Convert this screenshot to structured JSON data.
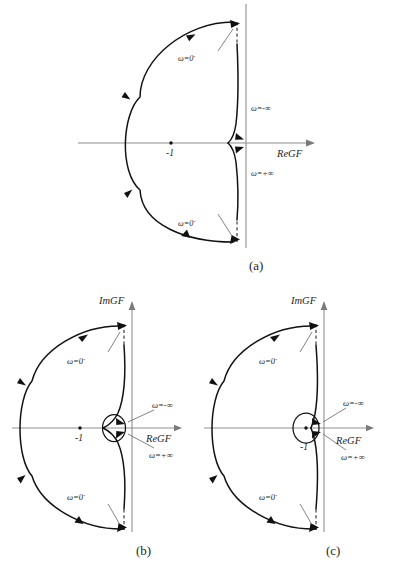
{
  "figure": {
    "title_visible": false,
    "panels": [
      {
        "id": "a",
        "caption": "(a)",
        "axis_labels": {
          "real": "ReGF",
          "imag": ""
        },
        "critical_point_label": "-1",
        "annotations": [
          {
            "name": "omega-zero-minus-upper",
            "text": "ω=0",
            "superscript": "-"
          },
          {
            "name": "omega-neg-infinity",
            "text": "ω=-∞",
            "superscript": ""
          },
          {
            "name": "omega-pos-infinity",
            "text": "ω=+∞",
            "superscript": ""
          },
          {
            "name": "omega-zero-minus-lower",
            "text": "ω=0",
            "superscript": "-"
          }
        ],
        "loop_encircles_minus_one": false,
        "has_small_loop": false
      },
      {
        "id": "b",
        "caption": "(b)",
        "axis_labels": {
          "real": "ReGF",
          "imag": "ImGF"
        },
        "critical_point_label": "-1",
        "annotations": [
          {
            "name": "omega-zero-minus-upper",
            "text": "ω=0",
            "superscript": "-"
          },
          {
            "name": "omega-neg-infinity",
            "text": "ω=-∞",
            "superscript": ""
          },
          {
            "name": "omega-pos-infinity",
            "text": "ω=+∞",
            "superscript": ""
          },
          {
            "name": "omega-zero-minus-lower",
            "text": "ω=0",
            "superscript": "-"
          }
        ],
        "loop_encircles_minus_one": false,
        "has_small_loop": true
      },
      {
        "id": "c",
        "caption": "(c)",
        "axis_labels": {
          "real": "ReGF",
          "imag": "ImGF"
        },
        "critical_point_label": "-1",
        "annotations": [
          {
            "name": "omega-zero-minus-upper",
            "text": "ω=0",
            "superscript": "-"
          },
          {
            "name": "omega-neg-infinity",
            "text": "ω=-∞",
            "superscript": ""
          },
          {
            "name": "omega-pos-infinity",
            "text": "ω=+∞",
            "superscript": ""
          },
          {
            "name": "omega-zero-minus-lower",
            "text": "ω=0",
            "superscript": "-"
          }
        ],
        "loop_encircles_minus_one": true,
        "has_small_loop": true
      }
    ],
    "colors": {
      "curve": "#121212",
      "axis": "#8f8f8f",
      "leader": "#6e6e6e",
      "background": "#ffffff",
      "text": "#1f1f1f"
    }
  }
}
